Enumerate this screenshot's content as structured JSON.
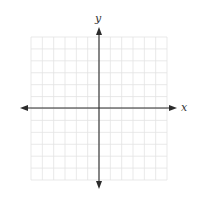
{
  "diagram": {
    "type": "coordinate-plane",
    "x_axis_label": "x",
    "y_axis_label": "y",
    "grid": {
      "columns": 12,
      "rows": 12,
      "left": 31,
      "top": 37,
      "right": 167,
      "bottom": 180
    },
    "origin": {
      "x": 99,
      "y": 108
    },
    "colors": {
      "grid": "#e3e3e3",
      "axis": "#2b2b2b",
      "background": "#ffffff"
    }
  }
}
